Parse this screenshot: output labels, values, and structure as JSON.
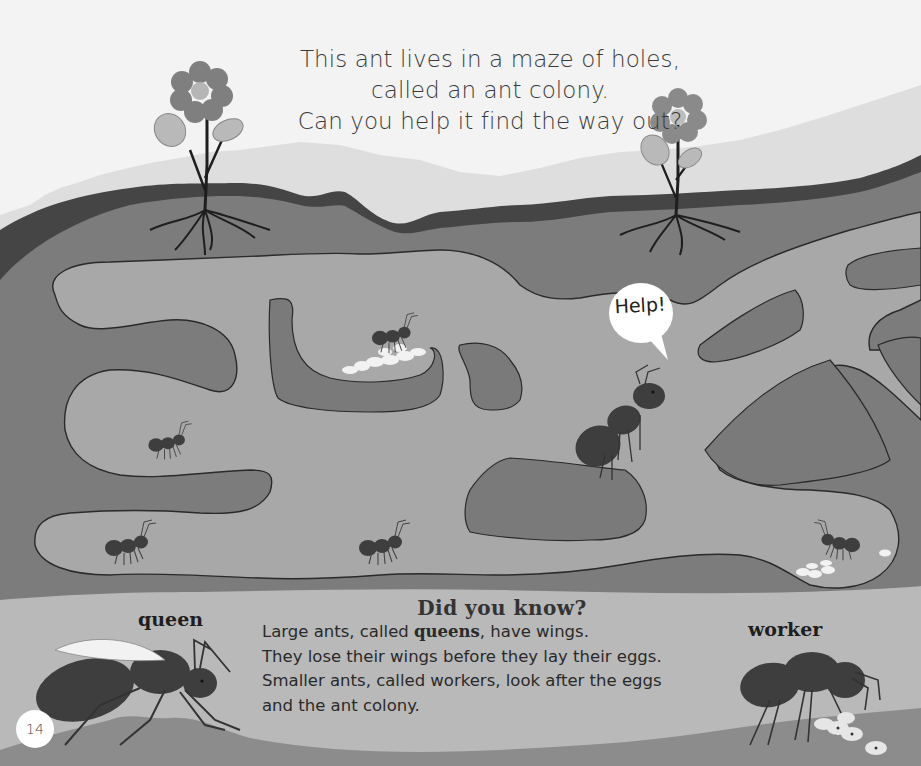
{
  "page": {
    "number": "14",
    "colors": {
      "sky": "#f3f3f3",
      "grass_light": "#e2e2e2",
      "topsoil_dark": "#454545",
      "soil": "#7c7c7c",
      "tunnel": "#a8a8a8",
      "chamber_dark": "#7a7a7a",
      "ant": "#3e3e3e",
      "eggs": "#f2f2f2",
      "flower_petal": "#7f7f7f",
      "flower_center": "#b6b6b6",
      "leaf": "#b9b9b9",
      "ground_bottom": "#8c8c8c"
    }
  },
  "intro": {
    "lines": [
      "This ant lives in a maze of holes,",
      "called an ant colony.",
      "Can you help it find the way out?"
    ]
  },
  "maze": {
    "speech_bubble": "Help!",
    "ants_count": 6,
    "egg_clusters": 2
  },
  "facts": {
    "title": "Did you know?",
    "line1_before": "Large ants, called ",
    "line1_bold": "queens",
    "line1_after": ", have wings.",
    "line2": "They lose their wings before they lay their eggs.",
    "line3": "Smaller ants, called workers, look after the eggs",
    "line4": "and the ant colony."
  },
  "labels": {
    "queen": "queen",
    "worker": "worker"
  }
}
